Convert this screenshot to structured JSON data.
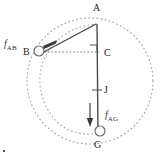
{
  "figure": {
    "type": "geometry-force-diagram",
    "width": 163,
    "height": 160,
    "background_color": "#ffffff",
    "stroke_color": "#4a4a4a",
    "dotted_color": "#999999",
    "label_color": "#222222"
  },
  "vertices": [
    {
      "id": "A",
      "label": "A",
      "x": 97,
      "y": 24,
      "label_x": 93,
      "label_y": 3,
      "marker": "none"
    },
    {
      "id": "B",
      "label": "B",
      "x": 39,
      "y": 52,
      "label_x": 23,
      "label_y": 51,
      "marker": "circle"
    },
    {
      "id": "C",
      "label": "C",
      "x": 97,
      "y": 52,
      "label_x": 104,
      "label_y": 52,
      "marker": "right-angle"
    },
    {
      "id": "J",
      "label": "J",
      "x": 97,
      "y": 90,
      "label_x": 104,
      "label_y": 85,
      "marker": "tick"
    },
    {
      "id": "G",
      "label": "G",
      "x": 98,
      "y": 133,
      "label_x": 94,
      "label_y": 142,
      "marker": "circle"
    }
  ],
  "forces": [
    {
      "id": "f_AB",
      "symbol": "f",
      "subscript": "AB",
      "label_x": 4,
      "label_y": 40,
      "direction": "toward-B",
      "arrow_from_x": 61,
      "arrow_from_y": 40,
      "arrow_to_x": 44,
      "arrow_to_y": 47
    },
    {
      "id": "f_AG",
      "symbol": "f",
      "subscript": "AG",
      "label_x": 105,
      "label_y": 112,
      "direction": "downward",
      "arrow_from_x": 90,
      "arrow_from_y": 104,
      "arrow_to_x": 90,
      "arrow_to_y": 126
    }
  ],
  "segments": [
    {
      "id": "A-B",
      "style": "solid",
      "from": "A",
      "to": "B"
    },
    {
      "id": "A-G",
      "style": "solid",
      "from": "A",
      "to": "G"
    },
    {
      "id": "B-C",
      "style": "dotted",
      "from": "B",
      "to": "C"
    }
  ],
  "circles": [
    {
      "id": "outer-circle",
      "style": "dotted",
      "cx": 90,
      "cy": 81,
      "r": 63
    },
    {
      "id": "inner-arc",
      "style": "dotted",
      "description": "arc through B and G bulging left"
    }
  ],
  "corner_mark": {
    "x": 3,
    "y": 150
  }
}
